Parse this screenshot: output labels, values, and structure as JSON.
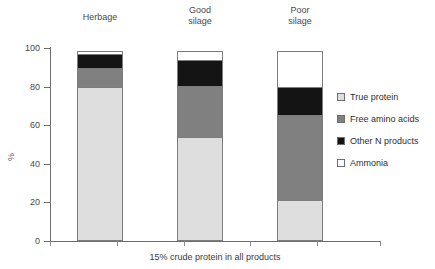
{
  "chart_data": {
    "type": "bar",
    "subtype": "stacked-100",
    "title": "",
    "xlabel": "15% crude protein in all products",
    "ylabel": "%",
    "ylim": [
      0,
      100
    ],
    "yticks": [
      0,
      20,
      40,
      60,
      80,
      100
    ],
    "ytick_labels": [
      "0",
      "20",
      "40",
      "60",
      "80",
      "100"
    ],
    "grid": false,
    "legend_position": "right",
    "categories": [
      "Herbage",
      "Good silage",
      "Poor silage"
    ],
    "category_labels": [
      "Herbage",
      "Good\nsilage",
      "Poor\nsilage"
    ],
    "series": [
      {
        "name": "True protein",
        "color": "#dedede",
        "values": [
          80,
          54,
          21
        ]
      },
      {
        "name": "Free amino acids",
        "color": "#808080",
        "values": [
          10,
          27,
          45
        ]
      },
      {
        "name": "Other N products",
        "color": "#141414",
        "values": [
          8,
          14,
          15
        ]
      },
      {
        "name": "Ammonia",
        "color": "#ffffff",
        "values": [
          2,
          5,
          19
        ]
      }
    ],
    "stack_order_bottom_to_top": [
      "True protein",
      "Free amino acids",
      "Other N products",
      "Ammonia"
    ],
    "axis_color": "#6e6e6e",
    "bar_border_color": "#7d7d7d"
  },
  "legend": {
    "items": [
      {
        "label": "True protein",
        "color": "#dedede"
      },
      {
        "label": "Free amino acids",
        "color": "#808080"
      },
      {
        "label": "Other N products",
        "color": "#141414"
      },
      {
        "label": "Ammonia",
        "color": "#ffffff"
      }
    ]
  }
}
